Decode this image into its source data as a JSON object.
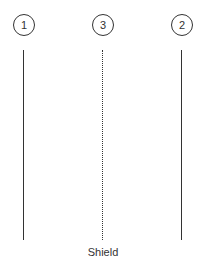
{
  "diagram": {
    "nodes": [
      {
        "id": "1",
        "label": "1",
        "line": "solid"
      },
      {
        "id": "3",
        "label": "3",
        "line": "dotted"
      },
      {
        "id": "2",
        "label": "2",
        "line": "solid"
      }
    ],
    "caption": "Shield"
  }
}
